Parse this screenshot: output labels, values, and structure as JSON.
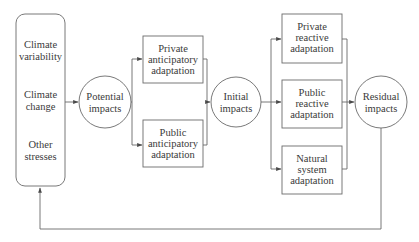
{
  "diagram": {
    "type": "flowchart",
    "title": "",
    "colors": {
      "stroke": "#6a6a6a",
      "text": "#3a3a3a",
      "background": "#ffffff"
    },
    "nodes": {
      "drivers": {
        "shape": "rounded-rectangle",
        "items": [
          [
            "Climate",
            "variability"
          ],
          [
            "Climate",
            "change"
          ],
          [
            "Other",
            "stresses"
          ]
        ]
      },
      "potential": {
        "shape": "circle",
        "lines": [
          "Potential",
          "impacts"
        ]
      },
      "private_anticipatory": {
        "shape": "rectangle",
        "lines": [
          "Private",
          "anticipatory",
          "adaptation"
        ]
      },
      "public_anticipatory": {
        "shape": "rectangle",
        "lines": [
          "Public",
          "anticipatory",
          "adaptation"
        ]
      },
      "initial": {
        "shape": "circle",
        "lines": [
          "Initial",
          "impacts"
        ]
      },
      "private_reactive": {
        "shape": "rectangle",
        "lines": [
          "Private",
          "reactive",
          "adaptation"
        ]
      },
      "public_reactive": {
        "shape": "rectangle",
        "lines": [
          "Public",
          "reactive",
          "adaptation"
        ]
      },
      "natural_system": {
        "shape": "rectangle",
        "lines": [
          "Natural",
          "system",
          "adaptation"
        ]
      },
      "residual": {
        "shape": "circle",
        "lines": [
          "Residual",
          "impacts"
        ]
      }
    },
    "edges": [
      {
        "from": "drivers",
        "to": "potential"
      },
      {
        "from": "potential",
        "to": "private_anticipatory"
      },
      {
        "from": "potential",
        "to": "public_anticipatory"
      },
      {
        "from": "private_anticipatory",
        "to": "initial"
      },
      {
        "from": "public_anticipatory",
        "to": "initial"
      },
      {
        "from": "initial",
        "to": "private_reactive"
      },
      {
        "from": "initial",
        "to": "public_reactive"
      },
      {
        "from": "initial",
        "to": "natural_system"
      },
      {
        "from": "private_reactive",
        "to": "residual"
      },
      {
        "from": "public_reactive",
        "to": "residual"
      },
      {
        "from": "natural_system",
        "to": "residual"
      },
      {
        "from": "residual",
        "to": "drivers",
        "kind": "feedback"
      }
    ]
  }
}
